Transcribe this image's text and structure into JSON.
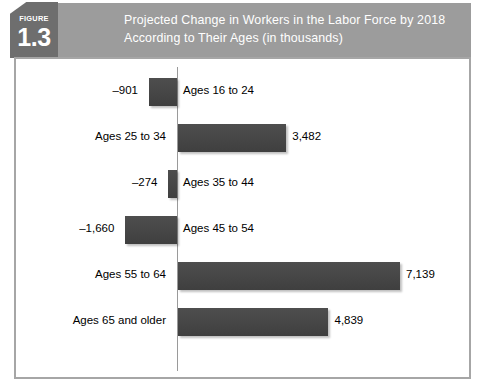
{
  "figure": {
    "badge_word": "FIGURE",
    "badge_number": "1.3",
    "title": "Projected Change in Workers in the Labor Force by 2018\nAccording to Their Ages (in thousands)"
  },
  "colors": {
    "header_band": "#9c9c9c",
    "badge": "#6e6e6e",
    "bar": "#4a4a4a",
    "panel_border": "#a6a6a6",
    "axis": "#9a9a9a",
    "title_text": "#ffffff",
    "body_text": "#000000"
  },
  "chart_data": {
    "type": "bar",
    "orientation": "horizontal",
    "title": "Projected Change in Workers in the Labor Force by 2018 According to Their Ages (in thousands)",
    "xlabel": "",
    "ylabel": "",
    "units": "thousands",
    "grid": false,
    "legend": null,
    "zero_line": true,
    "xlim": [
      -2000,
      7600
    ],
    "categories": [
      "Ages 16 to 24",
      "Ages 25 to 34",
      "Ages 35 to 44",
      "Ages 45 to 54",
      "Ages 55 to 64",
      "Ages 65 and older"
    ],
    "values": [
      -901,
      3482,
      -274,
      -1660,
      7139,
      4839
    ],
    "value_labels": [
      "–901",
      "3,482",
      "–274",
      "–1,660",
      "7,139",
      "4,839"
    ],
    "bars": [
      {
        "category": "Ages 16 to 24",
        "value": -901,
        "value_label": "–901",
        "sign": "negative"
      },
      {
        "category": "Ages 25 to 34",
        "value": 3482,
        "value_label": "3,482",
        "sign": "positive"
      },
      {
        "category": "Ages 35 to 44",
        "value": -274,
        "value_label": "–274",
        "sign": "negative"
      },
      {
        "category": "Ages 45 to 54",
        "value": -1660,
        "value_label": "–1,660",
        "sign": "negative"
      },
      {
        "category": "Ages 55 to 64",
        "value": 7139,
        "value_label": "7,139",
        "sign": "positive"
      },
      {
        "category": "Ages 65 and older",
        "value": 4839,
        "value_label": "4,839",
        "sign": "positive"
      }
    ]
  }
}
